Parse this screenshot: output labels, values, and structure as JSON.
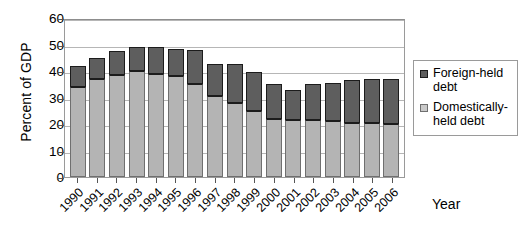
{
  "chart_data": {
    "type": "bar",
    "stacked": true,
    "title": "",
    "xlabel": "Year",
    "ylabel": "Percent of GDP",
    "ylim": [
      0,
      60
    ],
    "ytick_step": 10,
    "yticks": [
      60,
      50,
      40,
      30,
      20,
      10,
      0
    ],
    "grid": true,
    "legend_position": "right",
    "categories": [
      "1990",
      "1991",
      "1992",
      "1993",
      "1994",
      "1995",
      "1996",
      "1997",
      "1998",
      "1999",
      "2000",
      "2001",
      "2002",
      "2003",
      "2004",
      "2005",
      "2006"
    ],
    "series": [
      {
        "name": "Domestically-held debt",
        "color": "#b4b4b4",
        "values": [
          34,
          37,
          38.5,
          40,
          39,
          38,
          35,
          30.5,
          28,
          25,
          22,
          21.5,
          21.5,
          21,
          20.5,
          20.5,
          20
        ]
      },
      {
        "name": "Foreign-held debt",
        "color": "#5e5e5e",
        "values": [
          8,
          8,
          9,
          9,
          10,
          10.5,
          13,
          12,
          14.5,
          14.5,
          13,
          11.5,
          13.5,
          14.5,
          16,
          16.5,
          17
        ]
      }
    ],
    "totals": [
      42,
      45,
      47.5,
      49,
      49,
      48.5,
      48,
      42.5,
      42.5,
      39.5,
      35,
      33,
      35,
      35.5,
      36.5,
      37,
      37
    ]
  },
  "axes": {
    "y_title": "Percent of GDP",
    "x_title": "Year",
    "y_ticks": [
      "60",
      "50",
      "40",
      "30",
      "20",
      "10",
      "0"
    ],
    "x_ticks": [
      "1990",
      "1991",
      "1992",
      "1993",
      "1994",
      "1995",
      "1996",
      "1997",
      "1998",
      "1999",
      "2000",
      "2001",
      "2002",
      "2003",
      "2004",
      "2005",
      "2006"
    ]
  },
  "legend": {
    "items": [
      {
        "label": "Foreign-held debt",
        "swatch": "foreign-swatch-icon"
      },
      {
        "label": "Domestically-held debt",
        "swatch": "domestic-swatch-icon"
      }
    ]
  }
}
